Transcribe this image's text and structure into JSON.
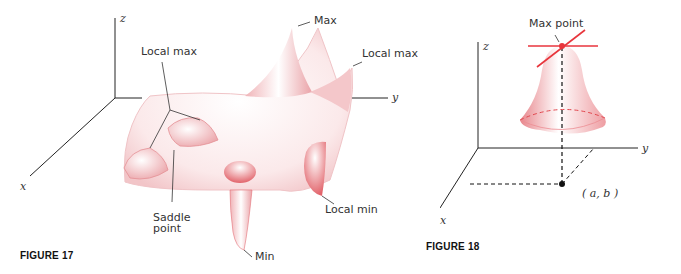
{
  "figure17": {
    "caption": "FIGURE 17",
    "axes": {
      "x": "x",
      "y": "y",
      "z": "z"
    },
    "labels": {
      "max": "Max",
      "local_max_left": "Local max",
      "local_max_right": "Local max",
      "saddle_line1": "Saddle",
      "saddle_line2": "point",
      "local_min": "Local min",
      "min": "Min"
    }
  },
  "figure18": {
    "caption": "FIGURE 18",
    "axes": {
      "x": "x",
      "y": "y",
      "z": "z"
    },
    "labels": {
      "max_point": "Max point",
      "point_ab": "( a, b )"
    }
  },
  "colors": {
    "surface": "#f6d6d8",
    "surface_edge": "#e07a80",
    "tangent": "#e8353c",
    "axis": "#222222"
  }
}
